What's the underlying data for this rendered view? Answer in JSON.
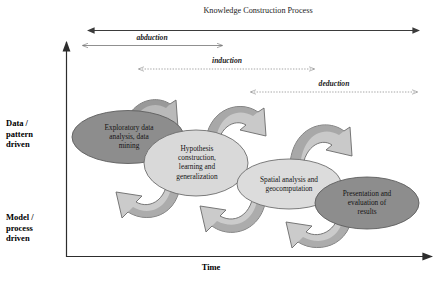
{
  "figure": {
    "title_band": "Knowledge Construction Process",
    "axes": {
      "y_top_label": "Data /\npattern\ndriven",
      "y_bottom_label": "Model /\nprocess\ndriven",
      "x_label": "Time"
    },
    "reasoning_arrows": [
      {
        "name": "abduction",
        "label": "abduction",
        "style": "solid"
      },
      {
        "name": "induction",
        "label": "induction",
        "style": "dotted"
      },
      {
        "name": "deduction",
        "label": "deduction",
        "style": "dotted"
      }
    ],
    "stages": [
      {
        "id": "exploratory-data-analysis",
        "label": "Exploratory data\nanalysis, data\nmining",
        "fill": "#8d8d8d"
      },
      {
        "id": "hypothesis-construction",
        "label": "Hypothesis\nconstruction,\nlearning and\ngeneralization",
        "fill": "#d9d9d9"
      },
      {
        "id": "spatial-analysis",
        "label": "Spatial analysis and\ngeocomputation",
        "fill": "#dcdcdc"
      },
      {
        "id": "presentation-evaluation",
        "label": "Presentation and\nevaluation of\nresults",
        "fill": "#8d8d8d"
      }
    ],
    "colors": {
      "axis": "#3a3a3a",
      "arrow_line": "#4a4a4a",
      "block_arrow_light": "#cfcfcf",
      "block_arrow_dark": "#9a9a9a",
      "background": "#ffffff"
    }
  }
}
